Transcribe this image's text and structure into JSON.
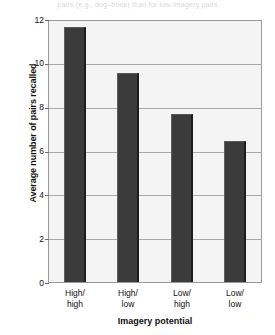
{
  "caption_fragment": "pairs (e.g., dog–book) than for low-imagery pairs",
  "chart_data": {
    "type": "bar",
    "title": "",
    "xlabel": "Imagery potential",
    "ylabel": "Average number of pairs recalled",
    "categories": [
      "High/\nhigh",
      "High/\nlow",
      "Low/\nhigh",
      "Low/\nlow"
    ],
    "category_lines": [
      [
        "High/",
        "high"
      ],
      [
        "High/",
        "low"
      ],
      [
        "Low/",
        "high"
      ],
      [
        "Low/",
        "low"
      ]
    ],
    "values": [
      11.7,
      9.6,
      7.7,
      6.5
    ],
    "ylim": [
      0,
      12
    ],
    "yticks": [
      0,
      2,
      4,
      6,
      8,
      10,
      12
    ],
    "ytick_labels": [
      "0",
      "2",
      "4",
      "6",
      "8",
      "10",
      "12"
    ],
    "grid": true,
    "legend": "none",
    "bar_color": "#3b3b3b",
    "plot_background": "#f4f4f4",
    "frame_color": "#9a9a9a",
    "gridline_color": "#a9a9a9"
  }
}
